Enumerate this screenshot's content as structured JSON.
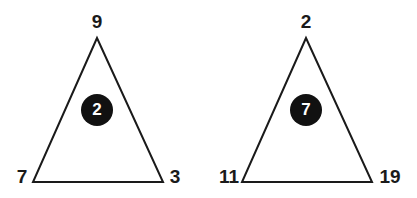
{
  "puzzle": {
    "triangles": [
      {
        "top": "9",
        "bottom_left": "7",
        "bottom_right": "3",
        "center": "2"
      },
      {
        "top": "2",
        "bottom_left": "11",
        "bottom_right": "19",
        "center": "7"
      }
    ],
    "colors": {
      "line": "#1a1a1a",
      "circle_fill": "#111111",
      "circle_text": "#ffffff",
      "background": "#ffffff"
    }
  }
}
